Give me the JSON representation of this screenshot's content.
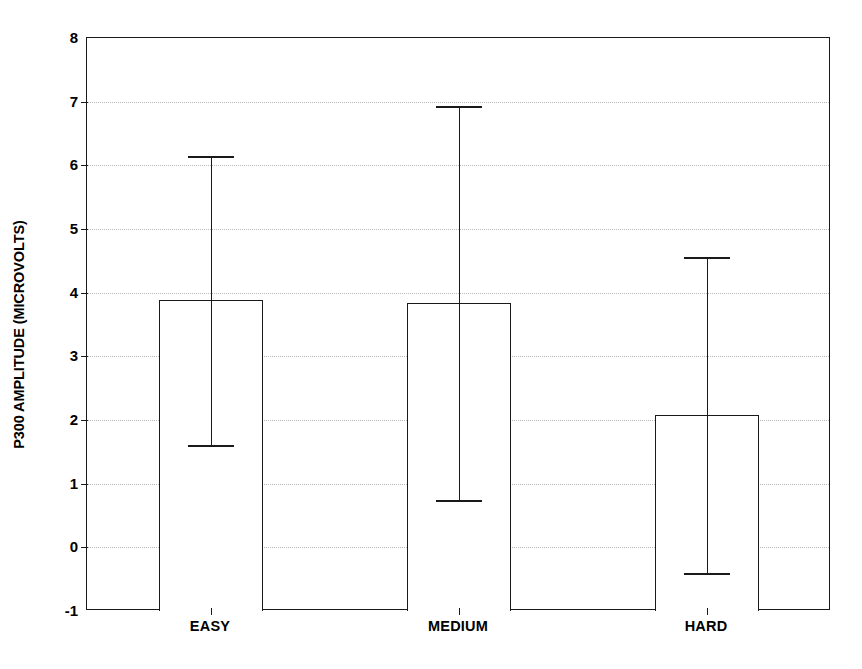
{
  "chart_data": {
    "type": "bar",
    "title": "",
    "subtitle": "",
    "xlabel": "",
    "ylabel": "P300 AMPLITUDE (MICROVOLTS)",
    "categories": [
      "EASY",
      "MEDIUM",
      "HARD"
    ],
    "values": [
      3.88,
      3.83,
      2.08
    ],
    "error_upper": [
      6.15,
      6.93,
      4.56
    ],
    "error_lower": [
      1.61,
      0.75,
      -0.4
    ],
    "error_bars": [
      {
        "category": "EASY",
        "value": 3.88,
        "upper": 6.15,
        "lower": 1.61
      },
      {
        "category": "MEDIUM",
        "value": 3.83,
        "upper": 6.93,
        "lower": 0.75
      },
      {
        "category": "HARD",
        "value": 2.08,
        "upper": 4.56,
        "lower": -0.4
      }
    ],
    "ylim": [
      -1,
      8
    ],
    "yticks": [
      -1,
      0,
      1,
      2,
      3,
      4,
      5,
      6,
      7,
      8
    ],
    "ytick_labels": [
      "-1",
      "0",
      "1",
      "2",
      "3",
      "4",
      "5",
      "6",
      "7",
      "8"
    ],
    "grid": true,
    "grid_axis": "y",
    "grid_style": "dotted",
    "legend": false,
    "legend_position": "none",
    "baseline": -1,
    "bar_fill": "#ffffff",
    "bar_edge_color": "#1a1a1a",
    "error_bar_color": "#1a1a1a",
    "axis_color": "#1a1a1a",
    "grid_color": "#b9b9b9",
    "background": "#ffffff"
  }
}
